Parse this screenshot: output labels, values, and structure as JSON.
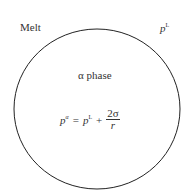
{
  "diagram": {
    "region_outside_label": "Melt",
    "outside_pressure": {
      "base": "p",
      "sup": "L"
    },
    "inside_label": "α phase",
    "equation": {
      "lhs_base": "p",
      "lhs_sup": "α",
      "eq": "=",
      "rhs_base": "p",
      "rhs_sup": "L",
      "plus": "+",
      "numerator": "2σ",
      "denominator": "r"
    },
    "colors": {
      "stroke": "#222222",
      "text": "#333333"
    }
  }
}
